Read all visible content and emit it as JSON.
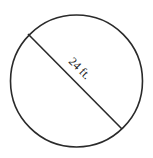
{
  "diagram": {
    "shape": "circle",
    "measurement": "diameter",
    "label": "24 ft.",
    "stroke_color": "#2a2a2a",
    "background": "#ffffff"
  }
}
